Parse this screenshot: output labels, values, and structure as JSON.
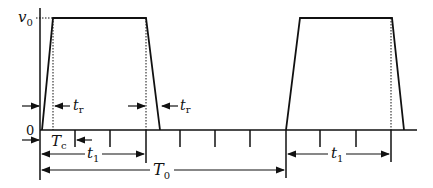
{
  "diagram": {
    "type": "pulse-waveform",
    "labels": {
      "amplitude": "v",
      "amplitude_sub": "0",
      "zero": "0",
      "rise_time_left": "t",
      "rise_time_left_sub": "r",
      "rise_time_right": "t",
      "rise_time_right_sub": "r",
      "conversion_time": "T",
      "conversion_time_sub": "c",
      "pulse_width": "t",
      "pulse_width_sub": "1",
      "period": "T",
      "period_sub": "0",
      "pulse_width_2": "t",
      "pulse_width_2_sub": "1"
    },
    "colors": {
      "stroke": "#111111",
      "background": "#ffffff"
    }
  }
}
